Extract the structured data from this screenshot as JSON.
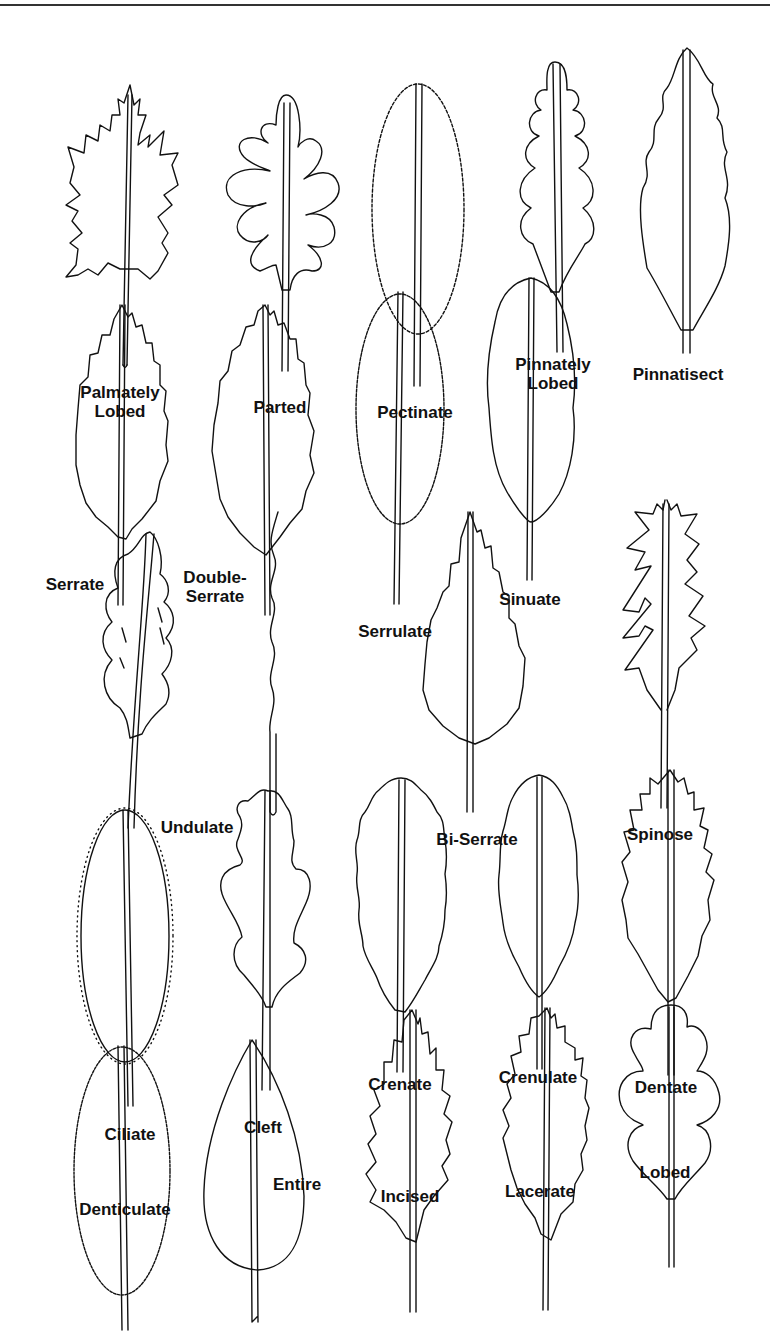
{
  "figure": {
    "type": "leaf-margin-illustration",
    "leaves": [
      {
        "id": "palmately-lobed",
        "lines": [
          "Palmately",
          "Lobed"
        ],
        "label_x": 120,
        "label_y": 383
      },
      {
        "id": "parted",
        "lines": [
          "Parted"
        ],
        "label_x": 280,
        "label_y": 398
      },
      {
        "id": "pectinate",
        "lines": [
          "Pectinate"
        ],
        "label_x": 415,
        "label_y": 403
      },
      {
        "id": "pinnately-lobed",
        "lines": [
          "Pinnately",
          "Lobed"
        ],
        "label_x": 553,
        "label_y": 355
      },
      {
        "id": "pinnatisect",
        "lines": [
          "Pinnatisect"
        ],
        "label_x": 678,
        "label_y": 365
      },
      {
        "id": "serrate",
        "lines": [
          "Serrate"
        ],
        "label_x": 75,
        "label_y": 575
      },
      {
        "id": "double-serrate",
        "lines": [
          "Double-",
          "Serrate"
        ],
        "label_x": 215,
        "label_y": 568
      },
      {
        "id": "serrulate",
        "lines": [
          "Serrulate"
        ],
        "label_x": 395,
        "label_y": 622
      },
      {
        "id": "sinuate",
        "lines": [
          "Sinuate"
        ],
        "label_x": 530,
        "label_y": 590
      },
      {
        "id": "undulate",
        "lines": [
          "Undulate"
        ],
        "label_x": 197,
        "label_y": 818
      },
      {
        "id": "bi-serrate",
        "lines": [
          "Bi-Serrate"
        ],
        "label_x": 477,
        "label_y": 830
      },
      {
        "id": "spinose",
        "lines": [
          "Spinose"
        ],
        "label_x": 660,
        "label_y": 825
      },
      {
        "id": "ciliate",
        "lines": [
          "Ciliate"
        ],
        "label_x": 130,
        "label_y": 1125
      },
      {
        "id": "cleft",
        "lines": [
          "Cleft"
        ],
        "label_x": 263,
        "label_y": 1118
      },
      {
        "id": "crenate",
        "lines": [
          "Crenate"
        ],
        "label_x": 400,
        "label_y": 1075
      },
      {
        "id": "crenulate",
        "lines": [
          "Crenulate"
        ],
        "label_x": 538,
        "label_y": 1068
      },
      {
        "id": "dentate",
        "lines": [
          "Dentate"
        ],
        "label_x": 666,
        "label_y": 1078
      },
      {
        "id": "denticulate",
        "lines": [
          "Denticulate"
        ],
        "label_x": 125,
        "label_y": 1200
      },
      {
        "id": "entire",
        "lines": [
          "Entire"
        ],
        "label_x": 297,
        "label_y": 1175
      },
      {
        "id": "incised",
        "lines": [
          "Incised"
        ],
        "label_x": 410,
        "label_y": 1187
      },
      {
        "id": "lacerate",
        "lines": [
          "Lacerate"
        ],
        "label_x": 540,
        "label_y": 1182
      },
      {
        "id": "lobed",
        "lines": [
          "Lobed"
        ],
        "label_x": 665,
        "label_y": 1163
      }
    ]
  }
}
